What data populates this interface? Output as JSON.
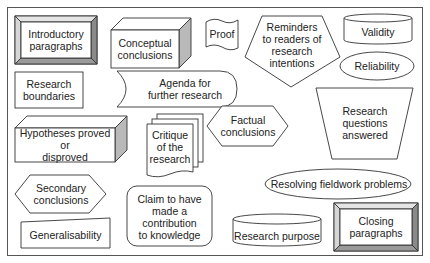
{
  "diagram": {
    "type": "shape-collage",
    "colors": {
      "stroke": "#333333",
      "bevel_dark": "#8a8a8a",
      "bevel_light": "#d8d8d8",
      "side": "#b9b9b9",
      "background": "#ffffff"
    },
    "shapes": [
      {
        "id": "introductory-paragraphs",
        "shape": "beveled-button",
        "label": "Introductory paragraphs"
      },
      {
        "id": "conceptual-conclusions",
        "shape": "3d-box",
        "label": "Conceptual conclusions"
      },
      {
        "id": "proof",
        "shape": "wavy-flag",
        "label": "Proof"
      },
      {
        "id": "reminders",
        "shape": "pentagon",
        "label": "Reminders to readers of research intentions"
      },
      {
        "id": "validity",
        "shape": "cylinder",
        "label": "Validity"
      },
      {
        "id": "reliability",
        "shape": "ellipse",
        "label": "Reliability"
      },
      {
        "id": "research-boundaries",
        "shape": "rectangle",
        "label": "Research boundaries"
      },
      {
        "id": "agenda",
        "shape": "stored-data",
        "label": "Agenda for further research"
      },
      {
        "id": "research-questions-answered",
        "shape": "inverted-trapezoid",
        "label": "Research questions answered"
      },
      {
        "id": "hypotheses",
        "shape": "3d-box",
        "label": "Hypotheses proved or disproved"
      },
      {
        "id": "critique",
        "shape": "multi-document",
        "label": "Critique of the research"
      },
      {
        "id": "factual-conclusions",
        "shape": "hexagon",
        "label": "Factual conclusions"
      },
      {
        "id": "secondary-conclusions",
        "shape": "hexagon",
        "label": "Secondary conclusions"
      },
      {
        "id": "resolving-fieldwork",
        "shape": "ellipse",
        "label": "Resolving fieldwork problems"
      },
      {
        "id": "generalisability",
        "shape": "manual-input",
        "label": "Generalisability"
      },
      {
        "id": "claim-contribution",
        "shape": "rounded-rectangle",
        "label": "Claim to have made a contribution to knowledge"
      },
      {
        "id": "research-purpose",
        "shape": "cylinder",
        "label": "Research purpose"
      },
      {
        "id": "closing-paragraphs",
        "shape": "beveled-button",
        "label": "Closing paragraphs"
      }
    ]
  },
  "labels": {
    "introductory_1": "Introductory",
    "introductory_2": "paragraphs",
    "conceptual_1": "Conceptual",
    "conceptual_2": "conclusions",
    "proof": "Proof",
    "reminders_1": "Reminders",
    "reminders_2": "to readers of",
    "reminders_3": "research",
    "reminders_4": "intentions",
    "validity": "Validity",
    "reliability": "Reliability",
    "boundaries_1": "Research",
    "boundaries_2": "boundaries",
    "agenda_1": "Agenda for",
    "agenda_2": "further research",
    "rqa_1": "Research",
    "rqa_2": "questions",
    "rqa_3": "answered",
    "hypotheses_1": "Hypotheses proved or",
    "hypotheses_2": "disproved",
    "critique_1": "Critique",
    "critique_2": "of the",
    "critique_3": "research",
    "factual_1": "Factual",
    "factual_2": "conclusions",
    "secondary_1": "Secondary",
    "secondary_2": "conclusions",
    "fieldwork": "Resolving fieldwork problems",
    "generalisability": "Generalisability",
    "claim_1": "Claim to have",
    "claim_2": "made a",
    "claim_3": "contribution",
    "claim_4": "to knowledge",
    "purpose": "Research purpose",
    "closing_1": "Closing",
    "closing_2": "paragraphs"
  }
}
